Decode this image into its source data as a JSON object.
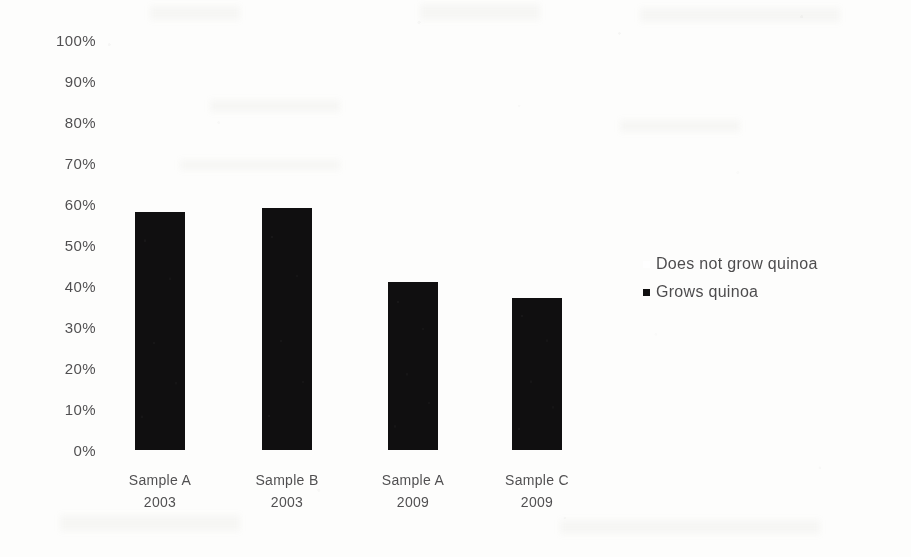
{
  "chart_data": {
    "type": "bar",
    "title": "",
    "subtitle": "",
    "xlabel": "",
    "ylabel": "",
    "categories": [
      {
        "name": "Sample A",
        "year": "2003"
      },
      {
        "name": "Sample B",
        "year": "2003"
      },
      {
        "name": "Sample A",
        "year": "2009"
      },
      {
        "name": "Sample C",
        "year": "2009"
      }
    ],
    "series": [
      {
        "name": "Grows quinoa",
        "color": "#100f10",
        "values": [
          58,
          59,
          41,
          37
        ]
      },
      {
        "name": "Does not grow quinoa",
        "color": "#ffffff",
        "values": [
          42,
          41,
          59,
          63
        ]
      }
    ],
    "values": [
      58,
      59,
      41,
      37
    ],
    "ylim": [
      0,
      100
    ],
    "ytick_values": [
      100,
      90,
      80,
      70,
      60,
      50,
      40,
      30,
      20,
      10,
      0
    ],
    "ytick_labels": [
      "100%",
      "90%",
      "80%",
      "70%",
      "60%",
      "50%",
      "40%",
      "30%",
      "20%",
      "10%",
      "0%"
    ],
    "grid": false,
    "legend_position": "right",
    "stacked": true
  },
  "legend": {
    "entries": [
      {
        "label": "Does not grow quinoa",
        "color": "#ffffff",
        "marker": "square"
      },
      {
        "label": "Grows quinoa",
        "color": "#100f10",
        "marker": "square"
      }
    ]
  },
  "colors": {
    "bar": "#100f10",
    "background": "#fdfdfc",
    "text": "#39383a"
  }
}
